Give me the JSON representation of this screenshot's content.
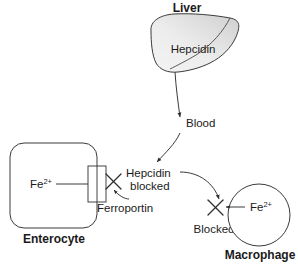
{
  "diagram": {
    "title_hidden": "Hepcidin regulation of iron export",
    "colors": {
      "stroke": "#3a3a3a",
      "text": "#1a1a1a",
      "liver_fill_light": "#f2f2f2",
      "liver_fill_dark": "#d4d4d4",
      "background": "#ffffff"
    },
    "labels": {
      "liver": "Liver",
      "hepcidin": "Hepcidin",
      "blood": "Blood",
      "hepcidin_blocked_line1": "Hepcidin",
      "hepcidin_blocked_line2": "blocked",
      "ferroportin": "Ferroportin",
      "enterocyte": "Enterocyte",
      "macrophage": "Macrophage",
      "blocked": "Blocked",
      "iron_symbol": "Fe",
      "iron_charge": "2+"
    },
    "nodes": [
      {
        "name": "liver",
        "label": "Liver",
        "shape": "organ",
        "inner_label": "Hepcidin"
      },
      {
        "name": "enterocyte",
        "label": "Enterocyte",
        "shape": "rounded-rect",
        "inner_label": "Fe2+"
      },
      {
        "name": "macrophage",
        "label": "Macrophage",
        "shape": "circle",
        "inner_label": "Fe2+"
      }
    ],
    "transporters": [
      {
        "name": "ferroportin",
        "label": "Ferroportin",
        "location": "enterocyte-membrane"
      }
    ],
    "block_markers": [
      {
        "name": "enterocyte-export-block",
        "label": "Hepcidin blocked"
      },
      {
        "name": "macrophage-export-block",
        "label": "Blocked"
      }
    ],
    "arrows": [
      {
        "name": "liver-to-blood",
        "from": "liver",
        "to": "blood",
        "label": "Blood"
      },
      {
        "name": "blood-to-hepcidin-blocked",
        "from": "blood",
        "to": "hepcidin-blocked"
      },
      {
        "name": "enterocyte-iron-export",
        "from": "enterocyte",
        "to": "ferroportin-channel"
      },
      {
        "name": "hepcidin-to-macrophage-block",
        "from": "hepcidin-blocked",
        "to": "macrophage-block"
      },
      {
        "name": "macrophage-iron-export",
        "from": "macrophage",
        "to": "macrophage-block"
      },
      {
        "name": "ferroportin-callout",
        "from": "ferroportin-label",
        "to": "ferroportin-channel"
      }
    ]
  }
}
